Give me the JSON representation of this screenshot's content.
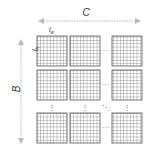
{
  "diagram": {
    "labels": {
      "width_dim": "C",
      "height_dim": "B",
      "tile_width": "l",
      "tile_width_sub": "w",
      "tile_height": "l",
      "tile_height_sub": "h"
    },
    "grid": {
      "block_rows_shown": 3,
      "block_cols_shown": 3,
      "cells_per_block": 9,
      "ellipsis_horizontal": "···",
      "ellipsis_vertical": "⋮",
      "ellipsis_diagonal": "⋱"
    },
    "colors": {
      "grid_line": "#555555",
      "arrow": "#bbbbbb",
      "text": "#333333"
    }
  }
}
